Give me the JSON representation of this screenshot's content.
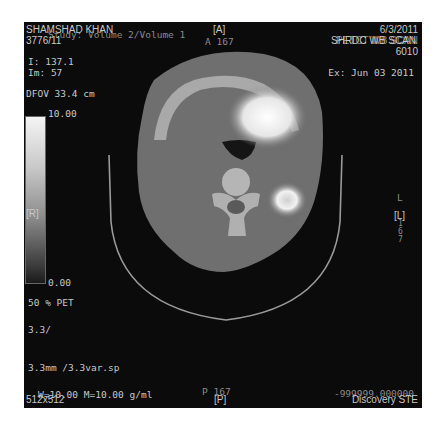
{
  "overlay": {
    "top_left": {
      "patient_name": "SHAMSHAD KHAN",
      "series": "Study: Volume 2/Volume 1",
      "patient_id": "3776/11",
      "image_position": "I: 137.1",
      "image_number": "Im: 57",
      "dfov": "DFOV 33.4 cm"
    },
    "top_center": {
      "orientation_top": "[A]",
      "anterior_position": "A 167"
    },
    "top_right": {
      "date": "6/3/2011",
      "study_description": "SHRDC WB SCAN",
      "study_description_overlap": "PETCT WB SCAN",
      "number": "6010",
      "exam_date": "Ex: Jun 03 2011"
    },
    "left": {
      "colorbar_max": "10.00",
      "colorbar_min": "0.00",
      "orientation_left": "[R]",
      "blend": "50 % PET",
      "thickness": "3.3/",
      "spacing": "3.3mm /3.3var.sp"
    },
    "right": {
      "orientation_right": "[L]",
      "side_label": "L",
      "lat_digits": "167"
    },
    "bottom_left": {
      "window": "W=10.00 M=10.00 g/ml",
      "matrix": "512x512"
    },
    "bottom_center": {
      "posterior_position": "P 167",
      "orientation_bottom": "[P]"
    },
    "bottom_right": {
      "value": "-999999.000000",
      "scanner": "Discovery STE"
    }
  },
  "colors": {
    "background": "#0b0b0b",
    "overlay_text": "#c8c8c8",
    "page": "#ffffff"
  }
}
